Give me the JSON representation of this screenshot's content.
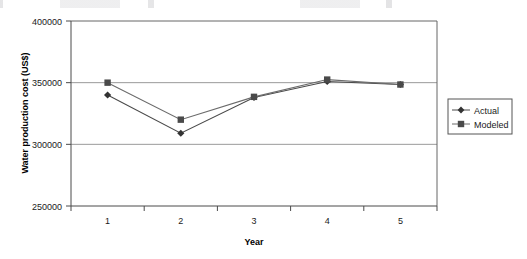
{
  "chart_data": {
    "type": "line",
    "title": "",
    "xlabel": "Year",
    "ylabel": "Water production cost (US$)",
    "categories": [
      "1",
      "2",
      "3",
      "4",
      "5"
    ],
    "x_tick_labels": [
      "1",
      "2",
      "3",
      "4",
      "5"
    ],
    "y_tick_labels": [
      "250000",
      "300000",
      "350000",
      "400000"
    ],
    "y_ticks": [
      250000,
      300000,
      350000,
      400000
    ],
    "ylim": [
      250000,
      400000
    ],
    "grid": "horizontal",
    "legend_position": "right",
    "series": [
      {
        "name": "Actual",
        "marker": "diamond",
        "color": "#4a4a4a",
        "values": [
          340000,
          309000,
          338000,
          351000,
          348500
        ]
      },
      {
        "name": "Modeled",
        "marker": "square",
        "color": "#6b6b6b",
        "values": [
          350000,
          320000,
          338500,
          352500,
          348500
        ]
      }
    ]
  },
  "legend": {
    "items": [
      {
        "label": "Actual"
      },
      {
        "label": "Modeled"
      }
    ]
  },
  "axes": {
    "y_title": "Water production cost (US$)",
    "x_title": "Year",
    "y_labels": {
      "t0": "250000",
      "t1": "300000",
      "t2": "350000",
      "t3": "400000"
    },
    "x_labels": {
      "c0": "1",
      "c1": "2",
      "c2": "3",
      "c3": "4",
      "c4": "5"
    }
  }
}
